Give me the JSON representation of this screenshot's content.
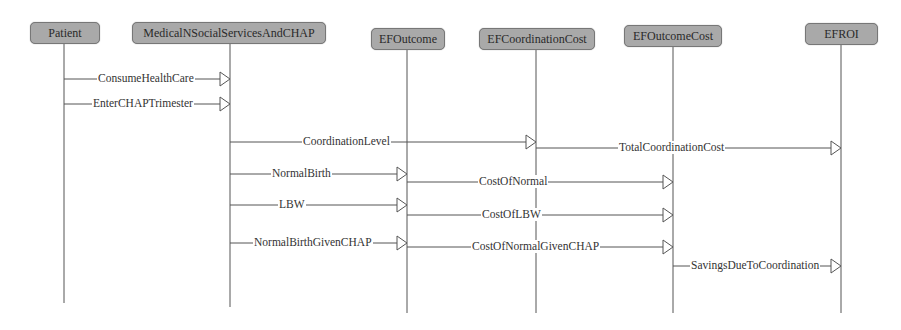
{
  "diagram": {
    "type": "sequence",
    "participants": [
      {
        "id": "patient",
        "label": "Patient",
        "x": 64,
        "box_left": 30,
        "box_top": 22,
        "box_width": 68,
        "lifeline_end": 303
      },
      {
        "id": "mnss",
        "label": "MedicalNSocialServicesAndCHAP",
        "x": 230,
        "box_left": 132,
        "box_top": 22,
        "box_width": 192,
        "lifeline_end": 307
      },
      {
        "id": "efoutcome",
        "label": "EFOutcome",
        "x": 407,
        "box_left": 371,
        "box_top": 28,
        "box_width": 72,
        "lifeline_end": 313
      },
      {
        "id": "efcoordcost",
        "label": "EFCoordinationCost",
        "x": 536,
        "box_left": 479,
        "box_top": 28,
        "box_width": 114,
        "lifeline_end": 313
      },
      {
        "id": "efoutcomecost",
        "label": "EFOutcomeCost",
        "x": 673,
        "box_left": 624,
        "box_top": 25,
        "box_width": 96,
        "lifeline_end": 313
      },
      {
        "id": "efroi",
        "label": "EFROI",
        "x": 841,
        "box_left": 805,
        "box_top": 23,
        "box_width": 71,
        "lifeline_end": 313
      }
    ],
    "messages": [
      {
        "label": "ConsumeHealthCare",
        "from": "patient",
        "to": "mnss",
        "y": 79,
        "label_x": 97
      },
      {
        "label": "EnterCHAPTrimester",
        "from": "patient",
        "to": "mnss",
        "y": 104,
        "label_x": 92
      },
      {
        "label": "CoordinationLevel",
        "from": "mnss",
        "to": "efcoordcost",
        "y": 142,
        "label_x": 302
      },
      {
        "label": "TotalCoordinationCost",
        "from": "efcoordcost",
        "to": "efroi",
        "y": 148,
        "label_x": 618
      },
      {
        "label": "NormalBirth",
        "from": "mnss",
        "to": "efoutcome",
        "y": 174,
        "label_x": 271
      },
      {
        "label": "CostOfNormal",
        "from": "efoutcome",
        "to": "efoutcomecost",
        "y": 182,
        "label_x": 478
      },
      {
        "label": "LBW",
        "from": "mnss",
        "to": "efoutcome",
        "y": 205,
        "label_x": 278
      },
      {
        "label": "CostOfLBW",
        "from": "efoutcome",
        "to": "efoutcomecost",
        "y": 215,
        "label_x": 481
      },
      {
        "label": "NormalBirthGivenCHAP",
        "from": "mnss",
        "to": "efoutcome",
        "y": 243,
        "label_x": 253
      },
      {
        "label": "CostOfNormalGivenCHAP",
        "from": "efoutcome",
        "to": "efoutcomecost",
        "y": 247,
        "label_x": 471
      },
      {
        "label": "SavingsDueToCoordination",
        "from": "efoutcomecost",
        "to": "efroi",
        "y": 266,
        "label_x": 690
      }
    ]
  }
}
